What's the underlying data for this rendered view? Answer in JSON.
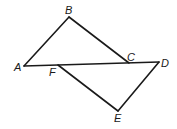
{
  "diagram": {
    "type": "geometry-figure",
    "points": {
      "A": {
        "label": "A",
        "x": 24,
        "y": 66,
        "lx": 14,
        "ly": 71
      },
      "B": {
        "label": "B",
        "x": 69,
        "y": 17,
        "lx": 65,
        "ly": 14
      },
      "C": {
        "label": "C",
        "x": 129,
        "y": 63,
        "lx": 127,
        "ly": 61
      },
      "D": {
        "label": "D",
        "x": 159,
        "y": 62,
        "lx": 161,
        "ly": 67
      },
      "E": {
        "label": "E",
        "x": 118,
        "y": 111,
        "lx": 114,
        "ly": 122
      },
      "F": {
        "label": "F",
        "x": 58,
        "y": 65,
        "lx": 49,
        "ly": 76
      }
    },
    "segments": [
      [
        "A",
        "B"
      ],
      [
        "B",
        "C"
      ],
      [
        "A",
        "D"
      ],
      [
        "F",
        "E"
      ],
      [
        "E",
        "D"
      ]
    ],
    "stroke_color": "#1a1a1a"
  }
}
